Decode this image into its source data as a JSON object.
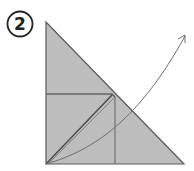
{
  "diagram": {
    "step_number": "2",
    "colors": {
      "paper_fill": "#bdbdbd",
      "edge_stroke": "#5a5a5a",
      "crease_stroke": "#666666",
      "arrow_stroke": "#6e6e6e",
      "circle_stroke": "#222222"
    },
    "shapes": {
      "paper_triangle": "right-triangle",
      "fold_arrow": "curved-arrow-up-right"
    }
  }
}
